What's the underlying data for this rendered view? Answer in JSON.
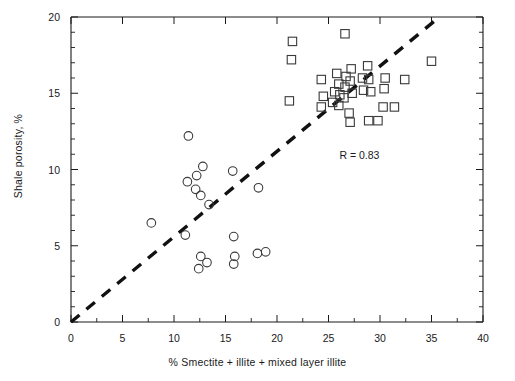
{
  "chart_data": {
    "type": "scatter",
    "title": "",
    "xlabel": "% Smectite + illite + mixed layer illite",
    "ylabel": "Shale porosity, %",
    "xlim": [
      0,
      40
    ],
    "ylim": [
      0,
      20
    ],
    "xticks": [
      0,
      5,
      10,
      15,
      20,
      25,
      30,
      35,
      40
    ],
    "yticks": [
      0,
      5,
      10,
      15,
      20
    ],
    "xtick_labels": [
      "0",
      "5",
      "10",
      "15",
      "20",
      "25",
      "30",
      "35",
      "40"
    ],
    "ytick_labels": [
      "0",
      "5",
      "10",
      "15",
      "20"
    ],
    "minor_tick_interval_x": 2.5,
    "minor_tick_interval_y": 1,
    "grid": false,
    "legend": false,
    "annotations": [
      {
        "text": "R = 0.83",
        "x": 28.0,
        "y": 10.7
      }
    ],
    "trendline": {
      "style": "dashed",
      "color": "#111111",
      "x0": 0.0,
      "y0": 0.0,
      "x1": 35.4,
      "y1": 19.8
    },
    "series": [
      {
        "name": "circle-series",
        "marker": "circle",
        "color": "#3a3a3a",
        "points": [
          [
            7.8,
            6.5
          ],
          [
            11.1,
            5.7
          ],
          [
            11.4,
            12.2
          ],
          [
            11.3,
            9.2
          ],
          [
            12.2,
            9.6
          ],
          [
            12.8,
            10.2
          ],
          [
            12.1,
            8.7
          ],
          [
            12.6,
            8.3
          ],
          [
            12.6,
            4.3
          ],
          [
            12.4,
            3.5
          ],
          [
            13.2,
            3.9
          ],
          [
            13.4,
            7.7
          ],
          [
            15.7,
            9.9
          ],
          [
            15.8,
            5.6
          ],
          [
            15.9,
            4.3
          ],
          [
            15.8,
            3.8
          ],
          [
            18.2,
            8.8
          ],
          [
            18.1,
            4.5
          ],
          [
            18.9,
            4.6
          ]
        ]
      },
      {
        "name": "square-series",
        "marker": "square",
        "color": "#3a3a3a",
        "points": [
          [
            21.5,
            18.4
          ],
          [
            21.4,
            17.2
          ],
          [
            21.2,
            14.5
          ],
          [
            24.3,
            15.9
          ],
          [
            24.5,
            14.8
          ],
          [
            24.3,
            14.1
          ],
          [
            25.6,
            15.1
          ],
          [
            25.4,
            14.4
          ],
          [
            25.8,
            16.3
          ],
          [
            26.0,
            15.6
          ],
          [
            26.1,
            14.9
          ],
          [
            26.0,
            14.2
          ],
          [
            26.6,
            18.9
          ],
          [
            26.7,
            16.1
          ],
          [
            26.6,
            15.4
          ],
          [
            26.5,
            14.7
          ],
          [
            27.2,
            16.6
          ],
          [
            27.1,
            15.8
          ],
          [
            27.3,
            15.0
          ],
          [
            27.0,
            13.7
          ],
          [
            27.1,
            13.1
          ],
          [
            28.3,
            16.0
          ],
          [
            28.4,
            15.2
          ],
          [
            28.8,
            16.8
          ],
          [
            28.9,
            15.9
          ],
          [
            29.1,
            15.1
          ],
          [
            28.9,
            13.2
          ],
          [
            29.8,
            13.2
          ],
          [
            30.4,
            15.3
          ],
          [
            30.5,
            16.0
          ],
          [
            30.3,
            14.1
          ],
          [
            31.4,
            14.1
          ],
          [
            32.4,
            15.9
          ],
          [
            35.0,
            17.1
          ]
        ]
      }
    ]
  },
  "axes": {
    "x_title": "% Smectite + illite + mixed layer illite",
    "y_title": "Shale porosity, %"
  }
}
